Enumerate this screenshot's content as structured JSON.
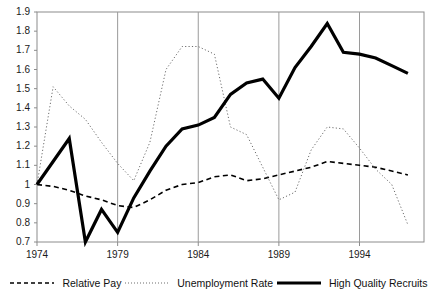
{
  "chart_data": {
    "type": "line",
    "title": "",
    "xlabel": "",
    "ylabel": "",
    "xlim": [
      1974,
      1998
    ],
    "ylim": [
      0.7,
      1.9
    ],
    "grid": "vertical-gridlines-at-xticks",
    "legend_position": "bottom",
    "xticks": [
      "1974",
      "1979",
      "1984",
      "1989",
      "1994"
    ],
    "xtick_values": [
      1974,
      1979,
      1984,
      1989,
      1994
    ],
    "yticks": [
      "0.7",
      "0.8",
      "0.9",
      "1",
      "1.1",
      "1.2",
      "1.3",
      "1.4",
      "1.5",
      "1.6",
      "1.7",
      "1.8",
      "1.9"
    ],
    "ytick_values": [
      0.7,
      0.8,
      0.9,
      1.0,
      1.1,
      1.2,
      1.3,
      1.4,
      1.5,
      1.6,
      1.7,
      1.8,
      1.9
    ],
    "x": [
      1974,
      1975,
      1976,
      1977,
      1978,
      1979,
      1980,
      1981,
      1982,
      1983,
      1984,
      1985,
      1986,
      1987,
      1988,
      1989,
      1990,
      1991,
      1992,
      1993,
      1994,
      1995,
      1996,
      1997
    ],
    "series": [
      {
        "name": "Relative Pay",
        "style": "dashed",
        "color": "#000000",
        "width": 1.6,
        "values": [
          1.0,
          0.99,
          0.97,
          0.94,
          0.92,
          0.89,
          0.88,
          0.92,
          0.97,
          1.0,
          1.01,
          1.04,
          1.05,
          1.02,
          1.03,
          1.05,
          1.07,
          1.09,
          1.12,
          1.11,
          1.1,
          1.09,
          1.07,
          1.05
        ]
      },
      {
        "name": "Unemployment Rate",
        "style": "dotted",
        "color": "#6e6e6e",
        "width": 1.0,
        "values": [
          1.0,
          1.51,
          1.41,
          1.34,
          1.22,
          1.11,
          1.02,
          1.22,
          1.6,
          1.72,
          1.72,
          1.68,
          1.3,
          1.26,
          1.09,
          0.92,
          0.96,
          1.18,
          1.3,
          1.29,
          1.19,
          1.08,
          1.0,
          0.79
        ]
      },
      {
        "name": "High Quality Recruits",
        "style": "solid-bold",
        "color": "#000000",
        "width": 3.2,
        "values": [
          1.0,
          1.12,
          1.24,
          0.7,
          0.87,
          0.75,
          0.93,
          1.07,
          1.2,
          1.29,
          1.31,
          1.35,
          1.47,
          1.53,
          1.55,
          1.45,
          1.61,
          1.72,
          1.84,
          1.69,
          1.68,
          1.66,
          1.62,
          1.58
        ]
      }
    ]
  },
  "legend": {
    "items": [
      {
        "label": "Relative Pay",
        "icon": "dashed-line-swatch"
      },
      {
        "label": "Unemployment Rate",
        "icon": "dotted-line-swatch"
      },
      {
        "label": "High Quality Recruits",
        "icon": "solid-line-swatch"
      }
    ]
  },
  "colors": {
    "axis": "#8c8c8c",
    "gridline": "#9a9a9a",
    "text": "#111111",
    "relative_pay": "#000000",
    "unemployment_rate": "#6e6e6e",
    "high_quality_recruits": "#000000",
    "background": "#ffffff"
  }
}
